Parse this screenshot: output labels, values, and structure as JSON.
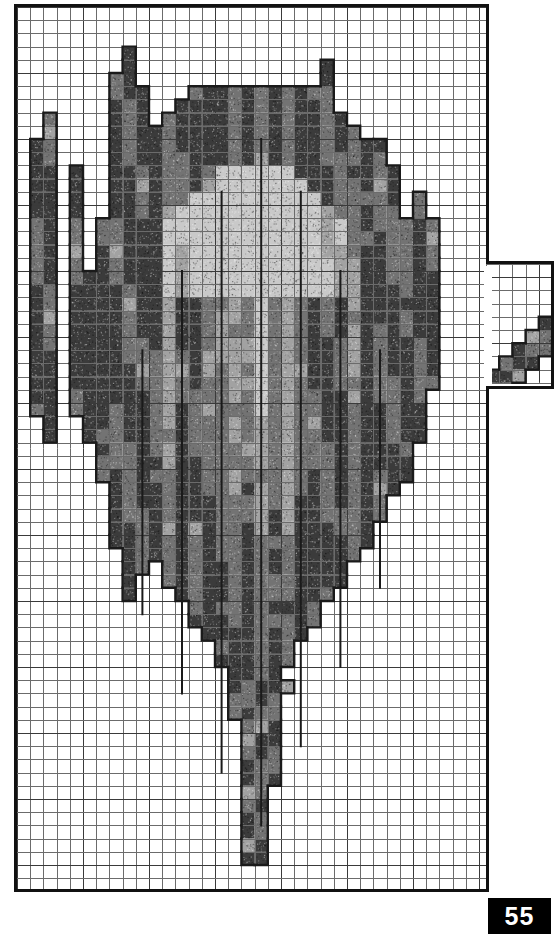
{
  "document": {
    "type": "cross-stitch-pattern-chart",
    "page_number": "55",
    "subject": "leaf-motif-grayscale-chart"
  },
  "grid": {
    "columns": 36,
    "rows": 67,
    "cell_size_px": 13.2,
    "origin_x_px": 14,
    "origin_y_px": 4,
    "border_color": "#111111",
    "line_color": "#6b6b6b",
    "major_line_color": "#3a3a3a",
    "major_every": 5,
    "background": "#ffffff"
  },
  "extension": {
    "label": "right-side-protrusion",
    "start_column": 36,
    "end_column": 41,
    "start_row": 19,
    "end_row": 29,
    "origin_x_px": 486,
    "origin_y_px": 261,
    "width_px": 68,
    "height_px": 128
  },
  "palette": {
    "symbols": [
      "blank",
      "light",
      "medium",
      "dark",
      "darkest"
    ],
    "colors": [
      "#ffffff",
      "#c9c9c9",
      "#a2a2a2",
      "#737373",
      "#3b3b3b"
    ],
    "outline_color": "#1a1a1a"
  },
  "chart_data": {
    "type": "heatmap",
    "xlabel": "",
    "ylabel": "",
    "grid": true,
    "legend": "none",
    "categories": [
      "blank",
      "light",
      "medium",
      "dark",
      "darkest"
    ],
    "values_key": "0=blank 1=light 2=medium 3=dark 4=darkest",
    "cells": [
      "000000000000000000000000000000000000",
      "000000000000000000000000000000000000",
      "000000000000000000000000000000000000",
      "000000000000000000000000000000000000",
      "000000000000000000043000000000000000",
      "000000000000000000033000000000000000",
      "000000000000000000033000000000000000",
      "000000000000000000343000000000000000",
      "000000000000000000343000002000000000",
      "000000000000000000343000003200000000",
      "000000000000000000343000003210000000",
      "000000000000004000343000003210000000",
      "000000000000004300443400003210000000",
      "000000000000003210443400003210000000",
      "000000000000003210443400034210000000",
      "000000000000003210443400034310000000",
      "000000000000003210443401034310000000",
      "000000000000003210443421034310000000",
      "000000000000003210443421134310000000",
      "000000000000003210443421134310000000",
      "000000000000003210443421134310000000",
      "000000000000003210443421134310000000",
      "000000000000003210343421134310000000",
      "000000000000003210343421134310000000",
      "000000000000002210343421134310000000",
      "000000000000002210343421134310000000",
      "000000000000002210343421134310000000",
      "000000000000002210343421134310000000",
      "000000000000002210343421134310000000",
      "000000000000002210343421134310000000",
      "000000000000002210343421134310000000",
      "000000000000002210343421134310000000",
      "000000000000002210343421134310000000",
      "000000000000002210343421134310000000",
      "000000000000002210343421134310000000",
      "000000000000002210343421134310000000",
      "000000000000002210343421134310000000",
      "000000000000002210343421134310000000",
      "000000000000002210343421134310000000",
      "000000000000002210343421134310000000",
      "000000000000002210343421134310000000",
      "000000000000002210343421134310000000",
      "000000000000002210343421134310000000",
      "000000000000002210343421134310000000",
      "000000000000002210343421134310000000",
      "000000000000002210343421134310000000",
      "000000000000002210343421134310000000",
      "000000000000002210343421134310000000",
      "000000000000002210343421134310000000",
      "000000000000002210343421134310000000",
      "000000000000000210343421134310000000",
      "000000000000000010343421134310000000",
      "000000000000000010343421134310000000",
      "000000000000000000343421134300000000",
      "000000000000000000343421134300000000",
      "000000000000000000343421134300000000",
      "000000000000000000003421134000000000",
      "000000000000000000003421100000000000",
      "000000000000000000003421000000000000",
      "000000000000000000003421000000000000",
      "000000000000000000003210000000000000",
      "000000000000000000003210000000000000",
      "000000000000000000033100000000000000",
      "000000000000000000033000000000000000",
      "000000000000000000000000000000000000",
      "000000000000000000000000000000000000",
      "000000000000000000000000000000000000"
    ]
  }
}
